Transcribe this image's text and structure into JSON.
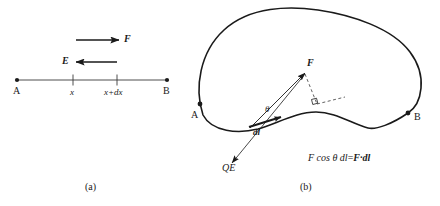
{
  "figure": {
    "background_color": "#ffffff",
    "stroke_color": "#1a1a1a",
    "panel_a": {
      "caption": "(a)",
      "axis_label_left": "A",
      "axis_label_right": "B",
      "tick_label_1": "x",
      "tick_label_2": "x+dx",
      "force_arrow_label": "F",
      "field_arrow_label": "E",
      "force_arrow_direction": "right",
      "field_arrow_direction": "left"
    },
    "panel_b": {
      "caption": "(b)",
      "path_start_label": "A",
      "path_end_label": "B",
      "force_vector_label": "F",
      "displacement_label": "dl",
      "angle_label": "θ",
      "charge_field_label": "QE",
      "equation": "F cos θ dl=F·dl",
      "equation_parts": {
        "scalar_form": "F cos θ dl",
        "equals": "=",
        "vector_form": "F·dl"
      },
      "right_angle_marker": "perpendicular"
    }
  }
}
